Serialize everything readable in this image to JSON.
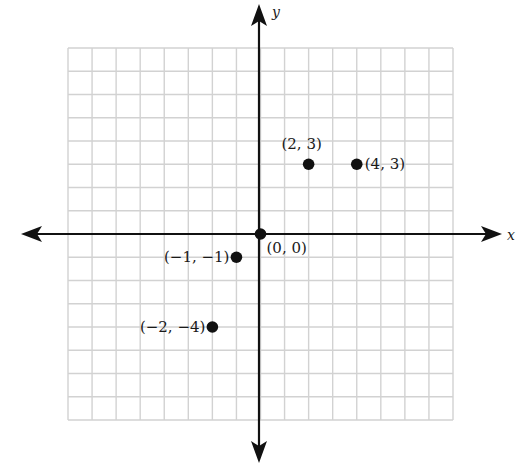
{
  "chart_data": {
    "type": "scatter",
    "title": "",
    "xlabel": "x",
    "ylabel": "y",
    "xlim": [
      -8,
      8
    ],
    "ylim": [
      -8,
      8
    ],
    "grid": true,
    "grid_step": 1,
    "axes_arrows": true,
    "series": [
      {
        "name": "points",
        "points": [
          {
            "x": 0,
            "y": 0,
            "label": "(0, 0)",
            "label_pos": "below-right"
          },
          {
            "x": 2,
            "y": 3,
            "label": "(2, 3)",
            "label_pos": "above"
          },
          {
            "x": 4,
            "y": 3,
            "label": "(4, 3)",
            "label_pos": "right"
          },
          {
            "x": -1,
            "y": -1,
            "label": "(−1, −1)",
            "label_pos": "left"
          },
          {
            "x": -2,
            "y": -4,
            "label": "(−2, −4)",
            "label_pos": "left"
          }
        ]
      }
    ]
  },
  "colors": {
    "grid": "#d2d2d2",
    "axes": "#111111",
    "points": "#111111",
    "background": "#ffffff"
  }
}
